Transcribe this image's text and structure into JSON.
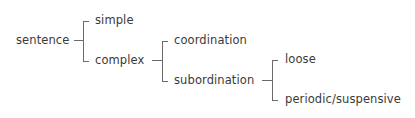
{
  "diagram": {
    "type": "tree",
    "root": "sentence",
    "nodes": {
      "sentence": "sentence",
      "simple": "simple",
      "complex": "complex",
      "coordination": "coordination",
      "subordination": "subordination",
      "loose": "loose",
      "periodic": "periodic/suspensive"
    },
    "edges": [
      [
        "sentence",
        "simple"
      ],
      [
        "sentence",
        "complex"
      ],
      [
        "complex",
        "coordination"
      ],
      [
        "complex",
        "subordination"
      ],
      [
        "subordination",
        "loose"
      ],
      [
        "subordination",
        "periodic/suspensive"
      ]
    ],
    "line_color": "#6a6a6a",
    "text_color": "#3a3a3a"
  }
}
